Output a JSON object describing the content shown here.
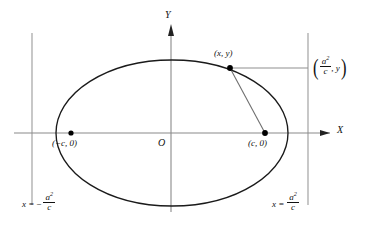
{
  "figure": {
    "axes": {
      "x_label": "X",
      "y_label": "Y",
      "origin_label": "O"
    },
    "points": [
      {
        "id": "left-focus",
        "label_open": "(",
        "label_body": "−c, 0",
        "label_close": ")",
        "x": 71,
        "y": 133
      },
      {
        "id": "right-focus",
        "label_open": "(",
        "label_body": "c, 0",
        "label_close": ")",
        "x": 265,
        "y": 133
      },
      {
        "id": "ellipse-point",
        "label_open": "(",
        "label_body": "x, y",
        "label_close": ")",
        "x": 230,
        "y": 68
      }
    ],
    "labels": {
      "point_xy": "(x, y)",
      "left_focus": "(−c, 0)",
      "right_focus": "(c, 0)",
      "directrix_point": "(a²/c, y)",
      "directrix_point_num": "a",
      "directrix_point_sup": "2",
      "directrix_point_den": "c",
      "directrix_point_second": ", y",
      "left_directrix_eq_lhs": "x =",
      "left_directrix_eq_sign": "−",
      "left_directrix_num": "a",
      "left_directrix_sup": "2",
      "left_directrix_den": "c",
      "right_directrix_eq_lhs": "x =",
      "right_directrix_num": "a",
      "right_directrix_sup": "2",
      "right_directrix_den": "c"
    },
    "geometry": {
      "ellipse_center_x": 172,
      "ellipse_center_y": 133,
      "ellipse_rx": 116,
      "ellipse_ry": 73,
      "x_axis_y": 133,
      "y_axis_x": 171,
      "left_directrix_x": 32,
      "right_directrix_x": 308,
      "directrix_top_y": 33,
      "directrix_bottom_y": 205
    },
    "colors": {
      "curve": "#1a1a1a",
      "axis": "#7a7a7a",
      "directrix": "#9a9a9a",
      "connector": "#8a8a8a",
      "point_fill": "#000000",
      "background": "#ffffff"
    }
  }
}
